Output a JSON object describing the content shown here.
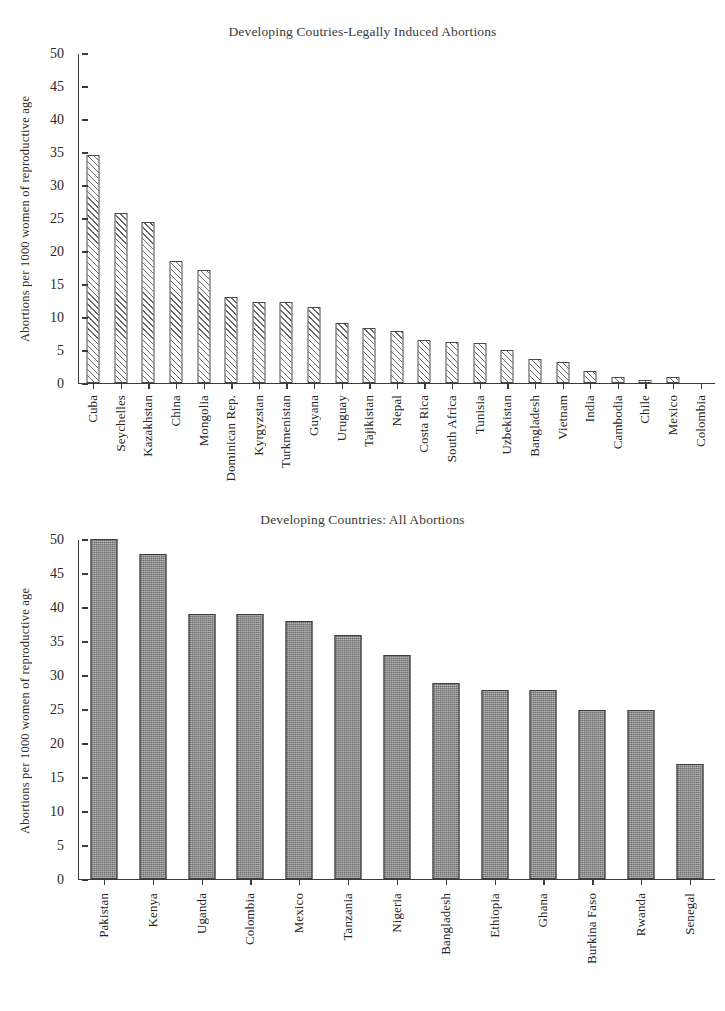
{
  "figure": {
    "ylabel": "Abortions per 1000 women of reproductive age"
  },
  "chart_data": [
    {
      "type": "bar",
      "id": "legally-induced",
      "title": "Developing Coutries-Legally Induced Abortions",
      "xlabel": "",
      "ylabel": "Abortions per 1000 women of reproductive age",
      "ylim": [
        0,
        50
      ],
      "yticks": [
        0,
        5,
        10,
        15,
        20,
        25,
        30,
        35,
        40,
        45,
        50
      ],
      "ytick_labels": [
        "0",
        "5",
        "10",
        "15",
        "20",
        "25",
        "30",
        "35",
        "40",
        "45",
        "50"
      ],
      "grid": false,
      "legend": "none",
      "bar_style": "hatched-diagonal",
      "categories": [
        "Cuba",
        "Seychelles",
        "Kazakhstan",
        "China",
        "Mongolia",
        "Dominican Rep.",
        "Kyrgyzstan",
        "Turkmenistan",
        "Guyana",
        "Uruguay",
        "Tajikistan",
        "Nepal",
        "Costa Rica",
        "South Africa",
        "Tunisia",
        "Uzbekistan",
        "Bangladesh",
        "Vietnam",
        "India",
        "Cambodia",
        "Chile",
        "Mexico",
        "Colombia"
      ],
      "values": [
        34.5,
        25.7,
        24.3,
        18.4,
        17.1,
        13.0,
        12.2,
        12.2,
        11.5,
        9.0,
        8.3,
        7.8,
        6.5,
        6.1,
        6.0,
        5.0,
        3.6,
        3.1,
        1.8,
        0.8,
        0.4,
        0.8,
        0.0
      ]
    },
    {
      "type": "bar",
      "id": "all-abortions",
      "title": "Developing Countries: All Abortions",
      "xlabel": "",
      "ylabel": "Abortions per 1000 women of reproductive age",
      "ylim": [
        0,
        50
      ],
      "yticks": [
        0,
        5,
        10,
        15,
        20,
        25,
        30,
        35,
        40,
        45,
        50
      ],
      "ytick_labels": [
        "0",
        "5",
        "10",
        "15",
        "20",
        "25",
        "30",
        "35",
        "40",
        "45",
        "50"
      ],
      "grid": false,
      "legend": "none",
      "bar_style": "solid-gray-stippled",
      "categories": [
        "Pakistan",
        "Kenya",
        "Uganda",
        "Colombia",
        "Mexico",
        "Tanzania",
        "Nigeria",
        "Bangladesh",
        "Ethiopia",
        "Ghana",
        "Burkina Faso",
        "Rwanda",
        "Senegal"
      ],
      "values": [
        50.0,
        47.8,
        38.9,
        38.9,
        37.9,
        35.9,
        32.9,
        28.8,
        27.8,
        27.8,
        24.8,
        24.8,
        16.8
      ]
    }
  ],
  "colors": {
    "bar_gray": "#6f6f6f",
    "hatch_line": "#6a6a6a",
    "axis": "#3a3a3a",
    "text": "#262626",
    "title": "#3a3a3a",
    "background": "#ffffff"
  }
}
